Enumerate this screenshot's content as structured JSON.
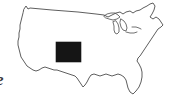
{
  "figure": {
    "background_color": "#ffffff",
    "width": 185,
    "height": 111
  },
  "map": {
    "region": "Continental United States",
    "outline_color": "#4c4c4c",
    "fill_color": "#ffffff",
    "features": [
      "national-border-outline",
      "great-lakes",
      "florida-peninsula",
      "new-england-coast",
      "gulf-coast",
      "pacific-coast"
    ]
  },
  "highlight": {
    "state_name": "Colorado",
    "shape": "rectangle",
    "fill_color": "#151515",
    "position": {
      "x": 56,
      "y": 42,
      "width": 25,
      "height": 20
    }
  },
  "edge_text": {
    "glyph": "e",
    "note": "partial cut-off italic character at left margin",
    "color": "#3a3a3a"
  }
}
